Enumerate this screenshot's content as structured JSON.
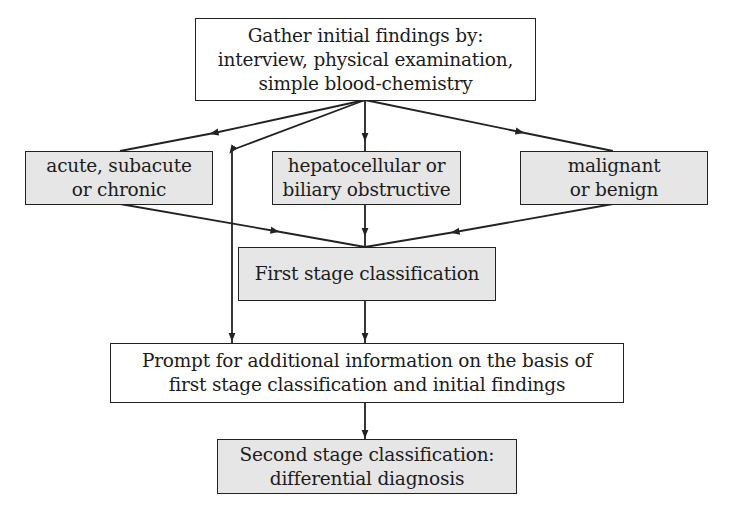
{
  "diagram": {
    "nodes": {
      "gather": {
        "lines": [
          "Gather initial findings by:",
          "interview, physical examination,",
          "simple blood-chemistry"
        ],
        "fill": "#ffffff"
      },
      "acute": {
        "lines": [
          "acute, subacute",
          "or chronic"
        ],
        "fill": "#e6e6e6"
      },
      "hepato": {
        "lines": [
          "hepatocellular or",
          "biliary obstructive"
        ],
        "fill": "#e6e6e6"
      },
      "malignant": {
        "lines": [
          "malignant",
          "or benign"
        ],
        "fill": "#e6e6e6"
      },
      "first_stage": {
        "lines": [
          "First stage classification"
        ],
        "fill": "#e6e6e6"
      },
      "prompt": {
        "lines": [
          "Prompt for additional information on the basis of",
          "first stage classification and initial findings"
        ],
        "fill": "#ffffff"
      },
      "second_stage": {
        "lines": [
          "Second stage classification:",
          "differential diagnosis"
        ],
        "fill": "#e6e6e6"
      }
    },
    "edges": [
      {
        "from": "gather",
        "to": "acute"
      },
      {
        "from": "gather",
        "to": "hepato"
      },
      {
        "from": "gather",
        "to": "malignant"
      },
      {
        "from": "gather",
        "to": "prompt"
      },
      {
        "from": "acute",
        "to": "first_stage"
      },
      {
        "from": "hepato",
        "to": "first_stage"
      },
      {
        "from": "malignant",
        "to": "first_stage"
      },
      {
        "from": "first_stage",
        "to": "prompt"
      },
      {
        "from": "prompt",
        "to": "second_stage"
      }
    ],
    "colors": {
      "stroke": "#222222",
      "gray_fill": "#e6e6e6",
      "white_fill": "#ffffff"
    }
  }
}
